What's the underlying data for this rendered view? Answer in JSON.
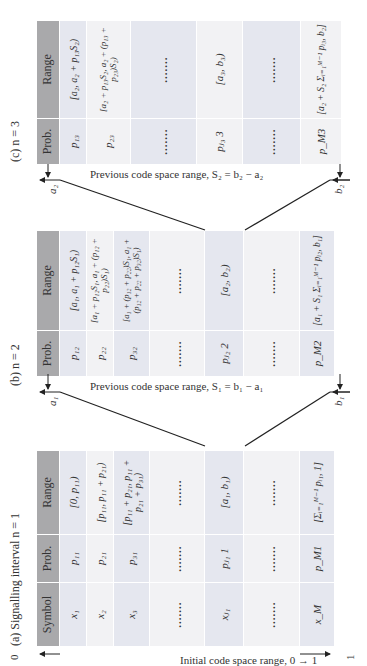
{
  "figure": {
    "orientation": "rotated 90 degrees counter-clockwise",
    "colors": {
      "header": "#a9a9ab",
      "row_odd": "#e5e7ef",
      "row_even": "#f2f2f4",
      "line": "#222222"
    }
  },
  "panel_a": {
    "caption": "(a) Signalling interval n = 1",
    "axis_label": "Initial code space range, 0 → 1",
    "axis_start": "0",
    "axis_end": "1",
    "headers": [
      "Symbol",
      "Prob.",
      "Range"
    ],
    "rows": [
      {
        "symbol": "x₁",
        "prob": "p₁₁",
        "range": "[0, p₁₁)"
      },
      {
        "symbol": "x₂",
        "prob": "p₂₁",
        "range": "[p₁₁, p₁₁ + p₂₁)"
      },
      {
        "symbol": "x₃",
        "prob": "p₃₁",
        "range": "[p₁₁ + p₂₁, p₁₁ + p₂₁ + p₃₁)"
      },
      {
        "symbol": ".......",
        "prob": ".......",
        "range": "......."
      },
      {
        "symbol": "xⱼ₁",
        "prob": "pⱼ₁ 1",
        "range": "[a₁, b₁)"
      },
      {
        "symbol": ".......",
        "prob": ".......",
        "range": "......."
      },
      {
        "symbol": "x_M",
        "prob": "p_M1",
        "range": "[Σᵢ₌₁ᴹ⁻¹ pᵢ₁, 1]"
      }
    ]
  },
  "panel_b": {
    "caption": "(b) n = 2",
    "axis_label": "Previous code space range, S₁ = b₁ − a₁",
    "axis_start": "a₁",
    "axis_end": "b₁",
    "headers": [
      "Prob.",
      "Range"
    ],
    "rows": [
      {
        "prob": "p₁₂",
        "range": "[a₁, a₁ + p₁₂S₁)"
      },
      {
        "prob": "p₂₂",
        "range": "[a₁ + p₁₂S₁, a₁ + (p₁₂ + p₂₂)S₁)"
      },
      {
        "prob": "p₃₂",
        "range": "[a₁ + (p₁₂ + p₂₂)S₁, a₁ + (p₁₂ + p₂₂ + p₃₂)S₁)"
      },
      {
        "prob": ".......",
        "range": "......."
      },
      {
        "prob": "pⱼ₂ 2",
        "range": "[a₂, b₂)"
      },
      {
        "prob": ".......",
        "range": "......."
      },
      {
        "prob": "p_M2",
        "range": "[a₁ + S₁ Σᵢ₌₁ᴹ⁻¹ pᵢ₂, b₁]"
      }
    ]
  },
  "panel_c": {
    "caption": "(c) n = 3",
    "axis_label": "Previous code space range, S₂ = b₂ − a₂",
    "axis_start": "a₂",
    "axis_end": "b₂",
    "headers": [
      "Prob.",
      "Range"
    ],
    "rows": [
      {
        "prob": "p₁₃",
        "range": "[a₂, a₂ + p₁₃S₂)"
      },
      {
        "prob": "p₂₃",
        "range": "[a₂ + p₁₃S₂, a₂ + (p₁₃ + p₂₃)S₂)"
      },
      {
        "prob": ".......",
        "range": "......."
      },
      {
        "prob": "pⱼ₃ 3",
        "range": "[a₃, b₃)"
      },
      {
        "prob": ".......",
        "range": "......."
      },
      {
        "prob": "p_M3",
        "range": "[a₂ + S₂ Σᵢ₌₁ᴹ⁻¹ pᵢ₃, b₂]"
      }
    ]
  }
}
